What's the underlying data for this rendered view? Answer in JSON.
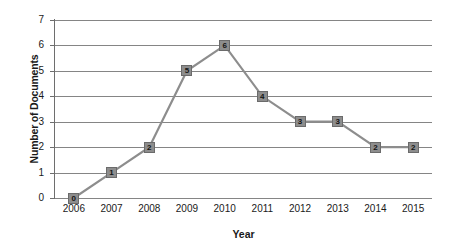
{
  "chart_data": {
    "type": "line",
    "title": "",
    "subtitle": "",
    "xlabel": "Year",
    "ylabel": "Number of Documents",
    "categories": [
      "2006",
      "2007",
      "2008",
      "2009",
      "2010",
      "2011",
      "2012",
      "2013",
      "2014",
      "2015"
    ],
    "values": [
      0,
      1,
      2,
      5,
      6,
      4,
      3,
      3,
      2,
      2
    ],
    "data_labels": [
      "0",
      "1",
      "2",
      "5",
      "6",
      "4",
      "3",
      "3",
      "2",
      "2"
    ],
    "ylim": [
      0,
      7
    ],
    "ytick_labels": [
      "0",
      "1",
      "2",
      "3",
      "4",
      "5",
      "6",
      "7"
    ],
    "ytick_values": [
      0,
      1,
      2,
      3,
      4,
      5,
      6,
      7
    ],
    "grid": "horizontal",
    "legend": "none",
    "series_name": "Number of Documents",
    "marker": "square",
    "colors": {
      "line": "#8d8d8d",
      "marker_fill": "#8d8d8d",
      "marker_border": "#6b6b6b",
      "data_label": "#141414",
      "gridline": "#858585",
      "axis": "#6e6e6e",
      "text": "#1a1a1a",
      "background": "#ffffff"
    }
  }
}
